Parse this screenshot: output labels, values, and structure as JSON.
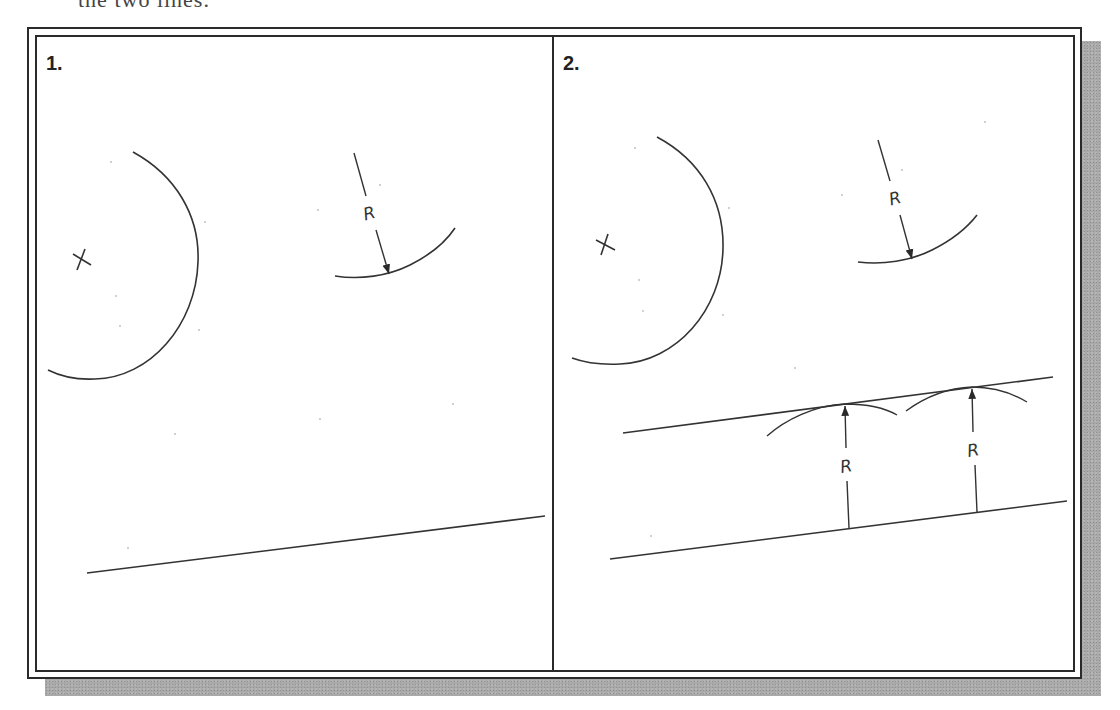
{
  "caption": {
    "text": "the two lines."
  },
  "panels": [
    {
      "label": "1.",
      "elements": {
        "center_mark": "x-center-mark",
        "large_arc": "circle-arc",
        "radius_dimension": {
          "label": "R"
        },
        "line": "inclined-line"
      }
    },
    {
      "label": "2.",
      "elements": {
        "center_mark": "x-center-mark",
        "large_arc": "circle-arc",
        "radius_dimension": {
          "label": "R"
        },
        "offset_arcs": [
          "arc-left",
          "arc-right"
        ],
        "offset_dimensions": [
          {
            "label": "R"
          },
          {
            "label": "R"
          }
        ],
        "original_line": "lower-inclined-line",
        "parallel_line": "upper-parallel-line"
      }
    }
  ],
  "colors": {
    "stroke": "#2a2a2a",
    "shadow": "#a9a9a9",
    "background": "#ffffff"
  }
}
